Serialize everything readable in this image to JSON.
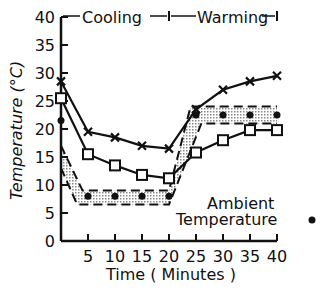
{
  "chart_data": {
    "type": "line",
    "title": "",
    "xlabel": "Time ( Minutes )",
    "ylabel": "Temperature (°C)",
    "xlim": [
      0,
      40
    ],
    "ylim": [
      0,
      40
    ],
    "x_ticks": [
      "5",
      "10",
      "15",
      "20",
      "25",
      "30",
      "35",
      "40"
    ],
    "y_ticks": [
      "0",
      "5",
      "10",
      "15",
      "20",
      "25",
      "30",
      "35",
      "40"
    ],
    "grid": false,
    "phases": [
      {
        "label": "Cooling",
        "from": 0,
        "to": 20
      },
      {
        "label": "Warming",
        "from": 20,
        "to": 40
      }
    ],
    "x": [
      0,
      5,
      10,
      15,
      20,
      25,
      30,
      35,
      40
    ],
    "series": [
      {
        "name": "x-marker series",
        "marker": "x",
        "values": [
          28.5,
          19.5,
          18.5,
          17,
          16.5,
          23.5,
          27,
          28.5,
          29.5
        ]
      },
      {
        "name": "square-marker series",
        "marker": "square",
        "values": [
          25.5,
          15.5,
          13.5,
          11.8,
          11.2,
          15.8,
          18,
          19.8,
          19.8
        ]
      },
      {
        "name": "Ambient Temperature",
        "marker": "dot",
        "values": [
          21.5,
          8,
          8,
          8,
          8,
          22.5,
          22.5,
          22.5,
          22.5
        ]
      }
    ],
    "shaded_band": {
      "upper": [
        [
          0,
          17
        ],
        [
          4,
          9
        ],
        [
          20,
          9
        ],
        [
          24,
          24
        ],
        [
          40,
          24
        ]
      ],
      "lower": [
        [
          0,
          13
        ],
        [
          3,
          6.5
        ],
        [
          20,
          6.5
        ],
        [
          26,
          21
        ],
        [
          40,
          21
        ]
      ]
    },
    "annotations": [
      "Ambient",
      "Temperature"
    ]
  },
  "labels": {
    "cooling": "Cooling",
    "warming": "Warming",
    "ambient_line1": "Ambient",
    "ambient_line2": "Temperature",
    "xlabel": "Time ( Minutes )",
    "ylabel": "Temperature (°C)"
  }
}
